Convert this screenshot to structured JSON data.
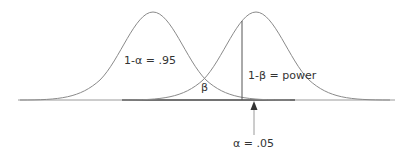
{
  "diagram": {
    "type": "statistical-power",
    "labels": {
      "null_region": "1-α = .95",
      "beta": "β",
      "power": "1-β = power",
      "alpha": "α = .05"
    },
    "colors": {
      "curve": "#8a8a8a",
      "axis": "#9a9a9a",
      "text": "#333333"
    }
  }
}
